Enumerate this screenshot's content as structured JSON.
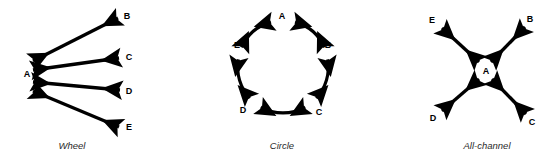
{
  "figure": {
    "background_color": "#ffffff",
    "stroke_color": "#000000",
    "caption_color": "#2b2b2b",
    "panels": [
      {
        "id": "wheel",
        "caption": "Wheel",
        "caption_x": 72,
        "caption_y": 140,
        "hub": "A",
        "nodes": [
          {
            "label": "A",
            "x": 27,
            "y": 74
          },
          {
            "label": "B",
            "x": 127,
            "y": 16
          },
          {
            "label": "C",
            "x": 129,
            "y": 57
          },
          {
            "label": "D",
            "x": 129,
            "y": 91
          },
          {
            "label": "E",
            "x": 129,
            "y": 127
          }
        ],
        "edges": [
          {
            "from": "A",
            "to": "B",
            "x1": 33,
            "y1": 61,
            "x2": 118,
            "y2": 18
          },
          {
            "from": "A",
            "to": "C",
            "x1": 33,
            "y1": 70,
            "x2": 119,
            "y2": 58
          },
          {
            "from": "A",
            "to": "D",
            "x1": 33,
            "y1": 82,
            "x2": 120,
            "y2": 90
          },
          {
            "from": "A",
            "to": "E",
            "x1": 33,
            "y1": 91,
            "x2": 119,
            "y2": 127
          }
        ]
      },
      {
        "id": "circle",
        "caption": "Circle",
        "caption_x": 282,
        "caption_y": 140,
        "center_x": 283,
        "center_y": 65,
        "radius": 45,
        "nodes": [
          {
            "label": "A",
            "x": 282,
            "y": 16,
            "angle": -90
          },
          {
            "label": "B",
            "x": 328,
            "y": 45,
            "angle": -18
          },
          {
            "label": "C",
            "x": 319,
            "y": 112,
            "angle": 54
          },
          {
            "label": "D",
            "x": 243,
            "y": 110,
            "angle": 126
          },
          {
            "label": "E",
            "x": 237,
            "y": 45,
            "angle": 198
          }
        ],
        "edges": [
          {
            "from": "E",
            "to": "A"
          },
          {
            "from": "A",
            "to": "B"
          },
          {
            "from": "B",
            "to": "C"
          },
          {
            "from": "C",
            "to": "D"
          },
          {
            "from": "D",
            "to": "E"
          }
        ]
      },
      {
        "id": "all-channel",
        "caption": "All-channel",
        "caption_x": 487,
        "caption_y": 140,
        "hub": "A",
        "nodes": [
          {
            "label": "A",
            "x": 486,
            "y": 71
          },
          {
            "label": "B",
            "x": 530,
            "y": 19
          },
          {
            "label": "C",
            "x": 532,
            "y": 122
          },
          {
            "label": "D",
            "x": 433,
            "y": 118
          },
          {
            "label": "E",
            "x": 432,
            "y": 20
          }
        ],
        "edges": [
          {
            "from": "A",
            "to": "B",
            "x1": 491,
            "y1": 62,
            "x2": 525,
            "y2": 27
          },
          {
            "from": "A",
            "to": "C",
            "x1": 492,
            "y1": 79,
            "x2": 526,
            "y2": 114
          },
          {
            "from": "A",
            "to": "D",
            "x1": 479,
            "y1": 79,
            "x2": 442,
            "y2": 111
          },
          {
            "from": "A",
            "to": "E",
            "x1": 479,
            "y1": 62,
            "x2": 442,
            "y2": 28
          }
        ]
      }
    ]
  }
}
